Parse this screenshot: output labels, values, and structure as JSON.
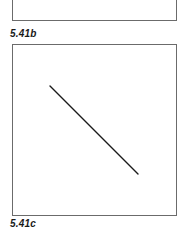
{
  "figures": [
    {
      "id": "b",
      "label": "5.41b",
      "panel": {
        "left": 12,
        "top": -10,
        "right": 177,
        "bottom": 21
      }
    },
    {
      "id": "c",
      "label": "5.41c",
      "panel": {
        "left": 12,
        "top": 44,
        "right": 177,
        "bottom": 216
      },
      "line": {
        "x1": 50,
        "y1": 86,
        "x2": 138,
        "y2": 174,
        "color": "#1a1a1a",
        "width": 1.4
      }
    }
  ],
  "colors": {
    "border": "#6b6b6b",
    "line": "#1a1a1a",
    "label": "#1a1a1a",
    "background": "#ffffff"
  }
}
